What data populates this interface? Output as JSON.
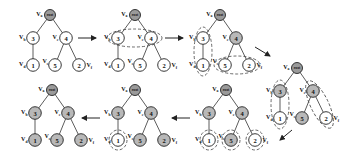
{
  "diagram": {
    "type": "tree-traversal-sequence",
    "root_label": "root",
    "vertex_labels": {
      "root": "Va",
      "n3": "Vb",
      "n4": "Vc",
      "n1": "Vd",
      "n5": "Ve",
      "n2": "Vf"
    },
    "node_values": {
      "n3": "3",
      "n4": "4",
      "n1": "1",
      "n5": "5",
      "n2": "2"
    },
    "edges": [
      [
        "root",
        "n3"
      ],
      [
        "root",
        "n4"
      ],
      [
        "n3",
        "n1"
      ],
      [
        "n4",
        "n5"
      ],
      [
        "n4",
        "n2"
      ]
    ],
    "stages": [
      {
        "id": 1,
        "shaded": [],
        "highlight_groups": []
      },
      {
        "id": 2,
        "shaded": [],
        "highlight_groups": [
          [
            "n3",
            "n4"
          ]
        ]
      },
      {
        "id": 3,
        "shaded": [
          "n4"
        ],
        "highlight_groups": [
          [
            "n3",
            "n1"
          ],
          [
            "n5",
            "n2"
          ]
        ]
      },
      {
        "id": 4,
        "shaded": [
          "n3",
          "n4",
          "n5"
        ],
        "highlight_groups": [
          [
            "n3",
            "n1"
          ],
          [
            "n4",
            "n2"
          ]
        ]
      },
      {
        "id": 5,
        "shaded": [
          "n3",
          "n4",
          "n5"
        ],
        "highlight_groups": [
          [
            "n1"
          ],
          [
            "n5"
          ],
          [
            "n2"
          ]
        ]
      },
      {
        "id": 6,
        "shaded": [
          "n3",
          "n4",
          "n5",
          "n2"
        ],
        "highlight_groups": [
          [
            "n1"
          ]
        ]
      },
      {
        "id": 7,
        "shaded": [
          "n3",
          "n4",
          "n5",
          "n2",
          "n1"
        ],
        "highlight_groups": []
      }
    ],
    "flow": [
      "stage-1 → stage-2 → stage-3 ↘ stage-4 ↙ stage-5 ← stage-6 ← stage-7"
    ]
  }
}
